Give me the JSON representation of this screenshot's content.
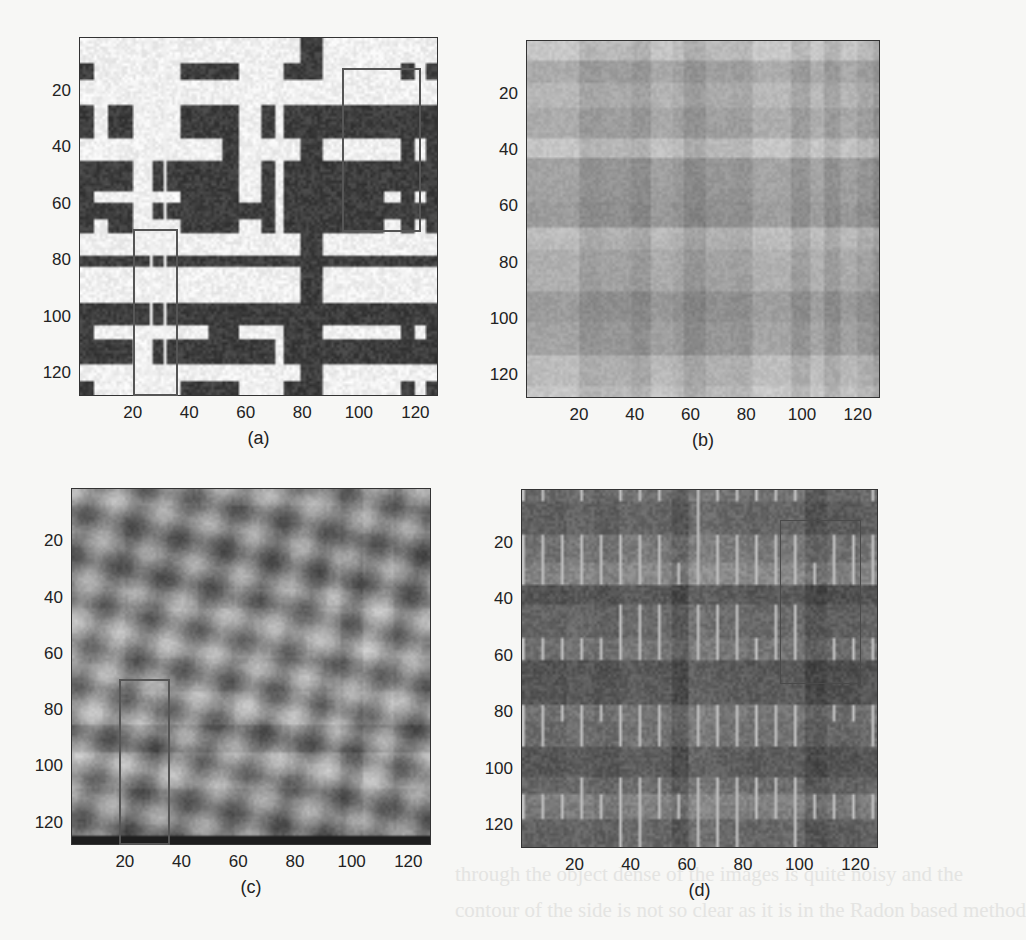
{
  "figure": {
    "panels": [
      {
        "id": "a",
        "caption": "(a)",
        "frame": {
          "left": 79,
          "top": 37,
          "width": 359,
          "height": 359
        },
        "style": "high-contrast",
        "y_ticks": [
          "20",
          "40",
          "60",
          "80",
          "100",
          "120"
        ],
        "x_ticks": [
          "20",
          "40",
          "60",
          "80",
          "100",
          "120"
        ],
        "highlight_boxes": [
          {
            "x0": 20,
            "x1": 36,
            "y0": 69,
            "y1": 128
          },
          {
            "x0": 94,
            "x1": 122,
            "y0": 12,
            "y1": 70
          }
        ]
      },
      {
        "id": "b",
        "caption": "(b)",
        "frame": {
          "left": 526,
          "top": 40,
          "width": 354,
          "height": 358
        },
        "style": "low-contrast-blocky",
        "y_ticks": [
          "20",
          "40",
          "60",
          "80",
          "100",
          "120"
        ],
        "x_ticks": [
          "20",
          "40",
          "60",
          "80",
          "100",
          "120"
        ],
        "highlight_boxes": []
      },
      {
        "id": "c",
        "caption": "(c)",
        "frame": {
          "left": 71,
          "top": 488,
          "width": 360,
          "height": 357
        },
        "style": "smooth-noisy",
        "y_ticks": [
          "20",
          "40",
          "60",
          "80",
          "100",
          "120"
        ],
        "x_ticks": [
          "20",
          "40",
          "60",
          "80",
          "100",
          "120"
        ],
        "highlight_boxes": [
          {
            "x0": 18,
            "x1": 36,
            "y0": 69,
            "y1": 128
          }
        ]
      },
      {
        "id": "d",
        "caption": "(d)",
        "frame": {
          "left": 521,
          "top": 489,
          "width": 357,
          "height": 359
        },
        "style": "dark-textured",
        "y_ticks": [
          "20",
          "40",
          "60",
          "80",
          "100",
          "120"
        ],
        "x_ticks": [
          "20",
          "40",
          "60",
          "80",
          "100",
          "120"
        ],
        "highlight_boxes": [
          {
            "x0": 93,
            "x1": 122,
            "y0": 12,
            "y1": 70
          }
        ]
      }
    ],
    "axis_range": [
      1,
      128
    ],
    "background_bleed_text": [
      "through the object dense of the images is quite noisy and the",
      "contour of the side is not so clear as it is in the Radon based method"
    ]
  },
  "chart_data": [
    {
      "type": "heatmap",
      "title": "(a)",
      "xlabel": "",
      "ylabel": "",
      "xlim": [
        1,
        128
      ],
      "ylim": [
        128,
        1
      ],
      "x_ticks": [
        20,
        40,
        60,
        80,
        100,
        120
      ],
      "y_ticks": [
        20,
        40,
        60,
        80,
        100,
        120
      ],
      "colormap": "gray",
      "annotations": [
        "box x 20-36, y 69-128",
        "box x 94-122, y 12-70"
      ]
    },
    {
      "type": "heatmap",
      "title": "(b)",
      "xlabel": "",
      "ylabel": "",
      "xlim": [
        1,
        128
      ],
      "ylim": [
        128,
        1
      ],
      "x_ticks": [
        20,
        40,
        60,
        80,
        100,
        120
      ],
      "y_ticks": [
        20,
        40,
        60,
        80,
        100,
        120
      ],
      "colormap": "gray",
      "annotations": [
        "dark spot near x 116, y 58"
      ]
    },
    {
      "type": "heatmap",
      "title": "(c)",
      "xlabel": "",
      "ylabel": "",
      "xlim": [
        1,
        128
      ],
      "ylim": [
        128,
        1
      ],
      "x_ticks": [
        20,
        40,
        60,
        80,
        100,
        120
      ],
      "y_ticks": [
        20,
        40,
        60,
        80,
        100,
        120
      ],
      "colormap": "gray",
      "annotations": [
        "box x 18-36, y 69-128"
      ]
    },
    {
      "type": "heatmap",
      "title": "(d)",
      "xlabel": "",
      "ylabel": "",
      "xlim": [
        1,
        128
      ],
      "ylim": [
        128,
        1
      ],
      "x_ticks": [
        20,
        40,
        60,
        80,
        100,
        120
      ],
      "y_ticks": [
        20,
        40,
        60,
        80,
        100,
        120
      ],
      "colormap": "gray",
      "annotations": [
        "box x 93-122, y 12-70"
      ]
    }
  ]
}
